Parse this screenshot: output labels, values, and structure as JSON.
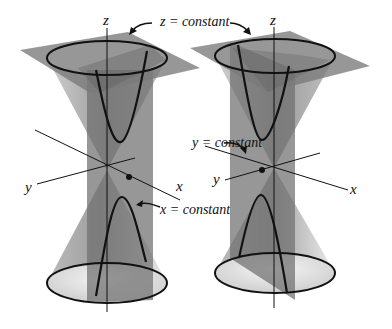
{
  "figure": {
    "labels": {
      "z_const": "z = constant",
      "y_const": "y = constant",
      "x_const": "x = constant",
      "left_z": "z",
      "left_y": "y",
      "left_x": "x",
      "right_z": "z",
      "right_y": "y",
      "right_x": "x"
    },
    "colors": {
      "cone": "#8a8a8a",
      "plane_dark": "#6e6e6e",
      "plane_light": "#9a9a9a",
      "curve": "#111111",
      "background": "#ffffff"
    }
  }
}
